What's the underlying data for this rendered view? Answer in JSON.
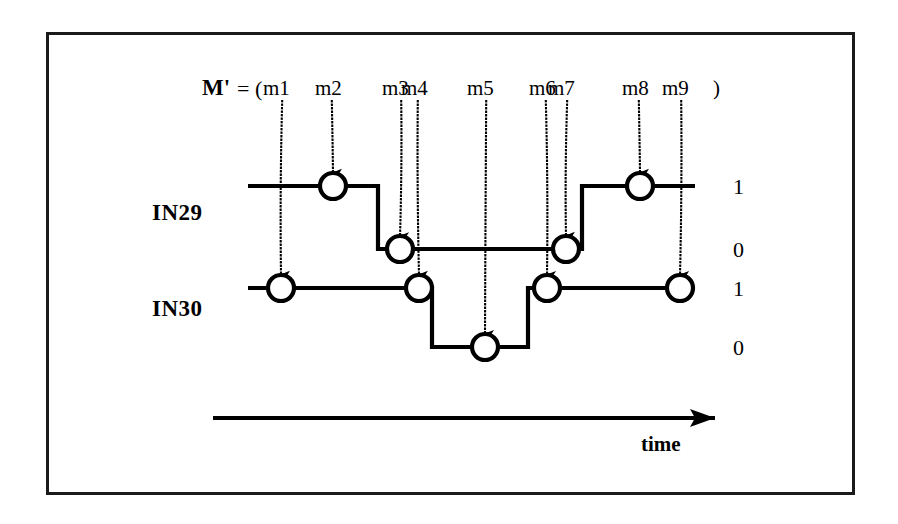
{
  "figure": {
    "border_color": "#1a1a1a",
    "ink_color": "#000000",
    "background": "#ffffff",
    "expression": {
      "name_label": "M'",
      "equals_label": "= (",
      "close_paren": ")"
    },
    "markers": [
      {
        "id": "m1",
        "label": "m1",
        "x": 281,
        "target_signal": "IN30",
        "target_y": 288,
        "level": "1"
      },
      {
        "id": "m2",
        "label": "m2",
        "x": 333,
        "target_signal": "IN29",
        "target_y": 186,
        "level": "1"
      },
      {
        "id": "m3",
        "label": "m3",
        "x": 400,
        "target_signal": "IN29",
        "target_y": 249,
        "level": "0"
      },
      {
        "id": "m4",
        "label": "m4",
        "x": 419,
        "target_signal": "IN30",
        "target_y": 288,
        "level": "1"
      },
      {
        "id": "m5",
        "label": "m5",
        "x": 485,
        "target_signal": "IN30",
        "target_y": 347,
        "level": "0"
      },
      {
        "id": "m6",
        "label": "m6",
        "x": 547,
        "target_signal": "IN30",
        "target_y": 288,
        "level": "1"
      },
      {
        "id": "m7",
        "label": "m7",
        "x": 566,
        "target_signal": "IN29",
        "target_y": 249,
        "level": "0"
      },
      {
        "id": "m8",
        "label": "m8",
        "x": 640,
        "target_signal": "IN29",
        "target_y": 186,
        "level": "1"
      },
      {
        "id": "m9",
        "label": "m9",
        "x": 680,
        "target_signal": "IN30",
        "target_y": 288,
        "level": "1"
      }
    ],
    "signals": [
      {
        "name": "IN29",
        "label": "IN29",
        "high_y": 186,
        "low_y": 249,
        "high_level_label": "1",
        "low_level_label": "0",
        "start_x": 248,
        "end_x": 695,
        "transitions": [
          {
            "x": 378,
            "from": "1",
            "to": "0"
          },
          {
            "x": 582,
            "from": "0",
            "to": "1"
          }
        ],
        "initial_level": "1"
      },
      {
        "name": "IN30",
        "label": "IN30",
        "high_y": 288,
        "low_y": 347,
        "high_level_label": "1",
        "low_level_label": "0",
        "start_x": 248,
        "end_x": 695,
        "transitions": [
          {
            "x": 432,
            "from": "1",
            "to": "0"
          },
          {
            "x": 528,
            "from": "0",
            "to": "1"
          }
        ],
        "initial_level": "1"
      }
    ],
    "axis": {
      "label": "time",
      "start_x": 213,
      "end_x": 715,
      "y": 418
    }
  }
}
